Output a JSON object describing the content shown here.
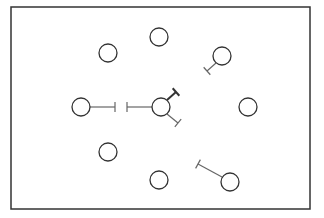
{
  "diagram": {
    "frame": {
      "x": 11,
      "y": 7,
      "width": 299,
      "height": 202,
      "stroke": "#333333"
    },
    "node_radius": 9,
    "node_stroke": "#333333",
    "edge_stroke": "#666666",
    "nodes": [
      {
        "id": "top",
        "cx": 159,
        "cy": 37
      },
      {
        "id": "upper-left",
        "cx": 108,
        "cy": 53
      },
      {
        "id": "upper-right",
        "cx": 222,
        "cy": 56
      },
      {
        "id": "left",
        "cx": 81,
        "cy": 107
      },
      {
        "id": "center",
        "cx": 161,
        "cy": 107
      },
      {
        "id": "right",
        "cx": 248,
        "cy": 107
      },
      {
        "id": "lower-left",
        "cx": 108,
        "cy": 152
      },
      {
        "id": "bottom",
        "cx": 159,
        "cy": 180
      },
      {
        "id": "lower-right",
        "cx": 230,
        "cy": 182
      }
    ],
    "inhibitory_edges": [
      {
        "from": "upper-right",
        "x1": 216,
        "y1": 63,
        "x2": 207,
        "y2": 71,
        "bar_len": 10,
        "thick": false
      },
      {
        "from": "left",
        "x1": 90,
        "y1": 107,
        "x2": 115,
        "y2": 107,
        "bar_len": 10,
        "thick": false
      },
      {
        "from": "center",
        "x1": 152,
        "y1": 107,
        "x2": 127,
        "y2": 107,
        "bar_len": 10,
        "thick": false
      },
      {
        "from": "center",
        "x1": 167,
        "y1": 100,
        "x2": 176,
        "y2": 92,
        "bar_len": 10,
        "thick": true
      },
      {
        "from": "center",
        "x1": 167,
        "y1": 114,
        "x2": 178,
        "y2": 123,
        "bar_len": 10,
        "thick": false
      },
      {
        "from": "lower-right",
        "x1": 222,
        "y1": 177,
        "x2": 198,
        "y2": 164,
        "bar_len": 10,
        "thick": false
      }
    ]
  }
}
